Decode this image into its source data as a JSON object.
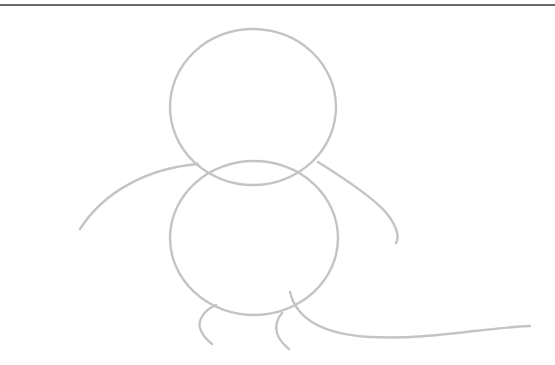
{
  "drawing": {
    "subject": "simple sketch of a creature (head, body, arms, legs, tail)",
    "stroke_color": "#c4c4c4",
    "border_color": "#6b6b6b",
    "background": "#ffffff",
    "shapes": {
      "head": {
        "cx": 253,
        "cy": 107,
        "rx": 83,
        "ry": 78
      },
      "body": {
        "cx": 254,
        "cy": 238,
        "rx": 84,
        "ry": 77
      },
      "left_arm": "M198 164 C150 168 105 190 80 229",
      "right_arm": "M318 162 C350 182 378 202 388 215 C396 226 400 236 396 243",
      "left_leg": "M216 305 C204 310 198 320 200 328 C202 335 207 340 212 344",
      "right_leg": "M282 313 C277 319 275 326 277 333 C279 340 284 345 289 349",
      "tail": "M290 292 C296 318 320 334 370 337 C430 340 480 328 530 326"
    }
  }
}
